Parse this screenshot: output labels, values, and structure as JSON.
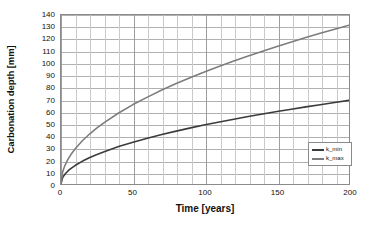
{
  "chart_data": {
    "type": "line",
    "title": "",
    "xlabel": "Time [years]",
    "ylabel": "Carbonation depth [mm]",
    "xlim": [
      0,
      200
    ],
    "ylim": [
      0,
      140
    ],
    "xticks": [
      0,
      50,
      100,
      150,
      200
    ],
    "yticks": [
      0,
      10,
      20,
      30,
      40,
      50,
      60,
      70,
      80,
      90,
      100,
      110,
      120,
      130,
      140
    ],
    "x_minor_step": 10,
    "y_minor_step": 10,
    "grid": true,
    "legend_position": "lower right",
    "x": [
      0,
      1,
      2,
      3,
      5,
      7,
      10,
      15,
      20,
      25,
      30,
      40,
      50,
      60,
      70,
      80,
      90,
      100,
      110,
      120,
      130,
      140,
      150,
      160,
      170,
      180,
      190,
      200
    ],
    "series": [
      {
        "name": "k_min",
        "label": "k_min",
        "color": "#3b3b3b",
        "values": [
          0,
          4.9,
          6.9,
          8.5,
          11.0,
          13.0,
          15.5,
          19.0,
          21.9,
          24.5,
          26.8,
          31.0,
          34.6,
          37.9,
          41.0,
          43.8,
          46.5,
          49.0,
          51.4,
          53.7,
          55.9,
          58.0,
          60.0,
          62.0,
          63.9,
          65.7,
          67.5,
          69.3
        ]
      },
      {
        "name": "k_max",
        "label": "k_max",
        "color": "#7d7d7d",
        "values": [
          0,
          9.3,
          13.1,
          16.1,
          20.8,
          24.6,
          29.4,
          36.0,
          41.6,
          46.5,
          50.9,
          58.8,
          65.8,
          72.0,
          77.8,
          83.2,
          88.2,
          93.0,
          97.5,
          101.9,
          106.0,
          110.0,
          113.9,
          117.7,
          121.3,
          124.8,
          128.2,
          131.5
        ]
      }
    ]
  }
}
